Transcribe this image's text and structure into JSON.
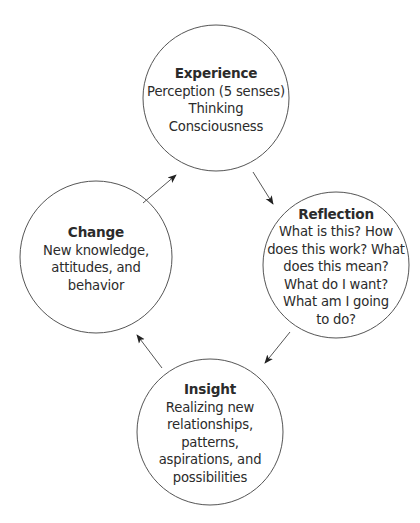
{
  "diagram": {
    "type": "cycle",
    "stroke_color": "#555555",
    "text_color": "#2b2b2b",
    "nodes": [
      {
        "id": "experience",
        "title": "Experience",
        "lines": [
          "Perception (5 senses)",
          "Thinking",
          "Consciousness"
        ],
        "cx": 216,
        "cy": 98,
        "r": 73
      },
      {
        "id": "reflection",
        "title": "Reflection",
        "lines": [
          "What is this? How",
          "does this work? What",
          "does this mean?",
          "What do I want?",
          "What am I going",
          "to do?"
        ],
        "cx": 336,
        "cy": 265,
        "r": 73
      },
      {
        "id": "insight",
        "title": "Insight",
        "lines": [
          "Realizing new",
          "relationships,",
          "patterns,",
          "aspirations, and",
          "possibilities"
        ],
        "cx": 210,
        "cy": 432,
        "r": 73
      },
      {
        "id": "change",
        "title": "Change",
        "lines": [
          "New knowledge,",
          "attitudes, and",
          "behavior"
        ],
        "cx": 96,
        "cy": 257,
        "r": 76
      }
    ],
    "edges": [
      {
        "from": "experience",
        "to": "reflection",
        "x1": 253,
        "y1": 172,
        "x2": 273,
        "y2": 204
      },
      {
        "from": "reflection",
        "to": "insight",
        "x1": 290,
        "y1": 332,
        "x2": 265,
        "y2": 363
      },
      {
        "from": "insight",
        "to": "change",
        "x1": 162,
        "y1": 368,
        "x2": 137,
        "y2": 335
      },
      {
        "from": "change",
        "to": "experience",
        "x1": 143,
        "y1": 203,
        "x2": 176,
        "y2": 175
      }
    ]
  }
}
